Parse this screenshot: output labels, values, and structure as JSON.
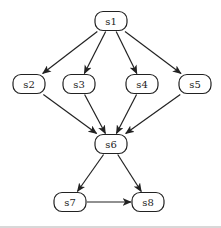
{
  "diagram": {
    "type": "directed-graph",
    "nodes": [
      {
        "id": "s1",
        "label": "s1",
        "cx": 111,
        "cy": 21
      },
      {
        "id": "s2",
        "label": "s2",
        "cx": 29,
        "cy": 84
      },
      {
        "id": "s3",
        "label": "s3",
        "cx": 79,
        "cy": 84
      },
      {
        "id": "s4",
        "label": "s4",
        "cx": 142,
        "cy": 84
      },
      {
        "id": "s5",
        "label": "s5",
        "cx": 195,
        "cy": 84
      },
      {
        "id": "s6",
        "label": "s6",
        "cx": 111,
        "cy": 144
      },
      {
        "id": "s7",
        "label": "s7",
        "cx": 70,
        "cy": 202
      },
      {
        "id": "s8",
        "label": "s8",
        "cx": 148,
        "cy": 202
      }
    ],
    "edges": [
      {
        "from": "s1",
        "to": "s2"
      },
      {
        "from": "s1",
        "to": "s3"
      },
      {
        "from": "s1",
        "to": "s4"
      },
      {
        "from": "s1",
        "to": "s5"
      },
      {
        "from": "s2",
        "to": "s6"
      },
      {
        "from": "s3",
        "to": "s6"
      },
      {
        "from": "s4",
        "to": "s6"
      },
      {
        "from": "s5",
        "to": "s6"
      },
      {
        "from": "s6",
        "to": "s7"
      },
      {
        "from": "s6",
        "to": "s8"
      },
      {
        "from": "s7",
        "to": "s8"
      }
    ],
    "colors": {
      "stroke": "#222222",
      "fill": "#ffffff",
      "background": "#ffffff"
    }
  }
}
